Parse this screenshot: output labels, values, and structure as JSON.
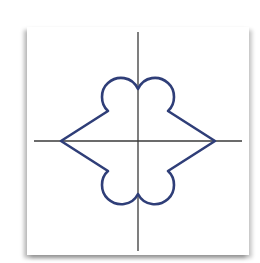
{
  "figure": {
    "colors": {
      "curve": "#2f3e78",
      "axes": "#3a3a3a",
      "paper": "#ffffff",
      "shadow": "#9a9a9a"
    },
    "axes": {
      "horizontal": {
        "x1": 34,
        "y1": 141,
        "x2": 242,
        "y2": 141
      },
      "vertical": {
        "x1": 138,
        "y1": 32,
        "x2": 138,
        "y2": 251
      }
    },
    "curve_key_points": {
      "left_vertex": [
        61,
        141
      ],
      "right_vertex": [
        215,
        141
      ],
      "upper_left_notch": [
        108,
        111
      ],
      "upper_right_notch": [
        168,
        111
      ],
      "top_cusp": [
        138,
        89
      ],
      "lobe_top_y": 78,
      "lower_left_notch": [
        108,
        171
      ],
      "lower_right_notch": [
        168,
        171
      ],
      "bottom_cusp": [
        138,
        194
      ],
      "lobe_bottom_y": 204
    }
  }
}
